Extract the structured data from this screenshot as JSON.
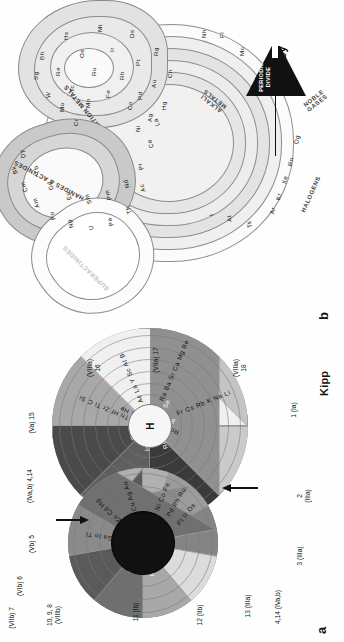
{
  "figure": {
    "panels": [
      {
        "letter": "a",
        "caption": "Kipp",
        "type": "circular-periodic-system",
        "center_element": "H",
        "group_labels": [
          {
            "id": "g-10-9-8",
            "text": "10, 9, 8\n(VIIIb)"
          },
          {
            "id": "g-11",
            "text": "11 (Ib)"
          },
          {
            "id": "g-12",
            "text": "12 (IIb)"
          },
          {
            "id": "g-13",
            "text": "13 (IIIa)"
          },
          {
            "id": "g-4-14",
            "text": "4,14 (IVa,b)"
          },
          {
            "id": "g-3",
            "text": "3 (IIIa)"
          },
          {
            "id": "g-2",
            "text": "2\n(IIIa)"
          },
          {
            "id": "g-1",
            "text": "1 (Ia)"
          },
          {
            "id": "g-18",
            "text": "(VIIIa)\n18"
          },
          {
            "id": "g-17",
            "text": "(VIIa) 17"
          },
          {
            "id": "g-16",
            "text": "(VIIIa)\n16"
          },
          {
            "id": "g-15",
            "text": "(Va) 15"
          },
          {
            "id": "g-4-14-b",
            "text": "(IVa,b) 4,14"
          },
          {
            "id": "g-5",
            "text": "(Vb) 5"
          },
          {
            "id": "g-6",
            "text": "(VIb) 6"
          },
          {
            "id": "g-7",
            "text": "(VIIb) 7"
          }
        ],
        "sectors": [
          {
            "id": "sector-alkali",
            "label": "Fr Cs Rb K Na Li",
            "fill": "#c4c4c4"
          },
          {
            "id": "sector-alkaline-earth",
            "label": "Ra Ba Sr Ca Mg Be",
            "fill": "#909090"
          },
          {
            "id": "sector-group3",
            "label": "Ac La Y Sc Al B",
            "fill": "#f0f0f0"
          },
          {
            "id": "sector-group4",
            "label": "Th Hf Zr Ti C Si",
            "fill": "#a8a8a8"
          },
          {
            "id": "sector-group5",
            "label": "U Ta Nb V N P",
            "fill": "#4a4a4a"
          },
          {
            "id": "sector-group6",
            "label": "W Mo Cr O S Se",
            "fill": "#5f5f5f"
          },
          {
            "id": "sector-group7",
            "label": "Re Tc Mn F Cl Br",
            "fill": "#3a3a3a"
          },
          {
            "id": "sector-noble",
            "label": "Rn Xe Kr Ar Ne He",
            "fill": "#cacaca"
          },
          {
            "id": "sector-group13",
            "label": "Tl Ga In B Al",
            "fill": "#dcdcdc"
          },
          {
            "id": "sector-group12",
            "label": "Zn Cd Hg",
            "fill": "#848484"
          },
          {
            "id": "sector-group11",
            "label": "Cu Ag Au",
            "fill": "#9c9c9c"
          },
          {
            "id": "sector-group10",
            "label": "Ni Co Fe Pd Rh Ru Pt Ir Os",
            "fill": "#b0b0b0"
          },
          {
            "id": "sector-pbsn",
            "label": "Pb Sn Ge",
            "fill": "#6f6f6f"
          },
          {
            "id": "sector-bi",
            "label": "Bi Sb As",
            "fill": "#8a8a8a"
          },
          {
            "id": "sector-po",
            "label": "Po Te Se",
            "fill": "#707070"
          }
        ],
        "inner_labels": [
          "Ni Co Fe",
          "Pd Rh Ru",
          "Pt Ir Os",
          "Cu Ag Au",
          "Zn Cd Hg",
          "Ga In Tl",
          "Th Hf Zr",
          "U W Mo Cr",
          "Re Tc Mn"
        ],
        "arrows": [
          {
            "id": "arrow-upper",
            "points": "down-left"
          },
          {
            "id": "arrow-lower",
            "points": "up-right"
          }
        ]
      },
      {
        "letter": "b",
        "caption": "Benfey",
        "type": "spiral-periodic-table",
        "center_element": "H",
        "region_labels": [
          {
            "id": "label-transition-metals",
            "text": "TRANSITION METALS"
          },
          {
            "id": "label-lanthanides-actinides",
            "text": "LANTHANIDES & ACTINIDES"
          },
          {
            "id": "label-superactinides",
            "text": "SUPERACTINIDES"
          },
          {
            "id": "label-alkali-metals",
            "text": "ALKALI\nMETALS"
          },
          {
            "id": "label-noble-gases",
            "text": "NOBLE\nGASES"
          },
          {
            "id": "label-halogens",
            "text": "HALOGENS"
          }
        ],
        "periodic_divide": {
          "label": "PERIODIC\nDIVIDE",
          "marker": "triangle-with-white-arrow"
        },
        "core_elements": [
          "H",
          "He",
          "Li",
          "Be",
          "B",
          "C",
          "N",
          "O",
          "F",
          "Ne",
          "Na",
          "Mg"
        ],
        "spiral_rows": [
          [
            "Al",
            "Si",
            "P",
            "S",
            "Cl",
            "Ar"
          ],
          [
            "Ga",
            "Ge",
            "As",
            "Se",
            "Br",
            "Kr"
          ],
          [
            "In",
            "Sn",
            "Sb",
            "Te",
            "I",
            "Xe"
          ],
          [
            "Tl",
            "Pb",
            "Bi",
            "Po",
            "At",
            "Rn"
          ],
          [
            "Nh",
            "Fl",
            "Mc",
            "Lv",
            "Ts",
            "Og"
          ]
        ],
        "transition_rows": [
          [
            "Sc",
            "Ti",
            "V",
            "Cr",
            "Mn",
            "Fe",
            "Co",
            "Ni",
            "Cu",
            "Zn"
          ],
          [
            "Y",
            "Zr",
            "Nb",
            "Mo",
            "Tc",
            "Ru",
            "Rh",
            "Pd",
            "Ag",
            "Cd"
          ],
          [
            "Lu",
            "Hf",
            "Ta",
            "W",
            "Re",
            "Os",
            "Ir",
            "Pt",
            "Au",
            "Hg"
          ],
          [
            "Lr",
            "Rf",
            "Db",
            "Sg",
            "Bh",
            "Hs",
            "Mt",
            "Ds",
            "Rg",
            "Cn"
          ]
        ],
        "lanthanide_row": [
          "La",
          "Ce",
          "Pr",
          "Nd",
          "Pm",
          "Sm",
          "Eu",
          "Gd",
          "Tb",
          "Dy",
          "Ho",
          "Er",
          "Tm",
          "Yb"
        ],
        "actinide_row": [
          "Ac",
          "Th",
          "Pa",
          "U",
          "Np",
          "Pu",
          "Am",
          "Cm",
          "Bk",
          "Cf",
          "Es",
          "Fm",
          "Md",
          "No"
        ]
      }
    ]
  },
  "colors": {
    "background": "#ffffff",
    "stroke": "#8b8b8b",
    "text": "#111111",
    "dark_fill": "#111111",
    "light_fill": "#ededed"
  }
}
